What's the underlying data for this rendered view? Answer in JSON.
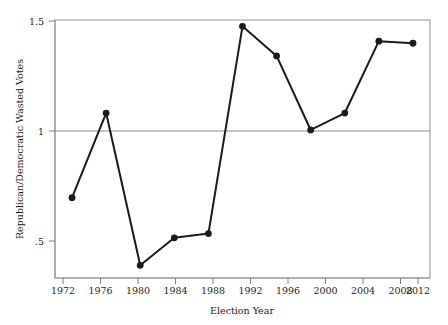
{
  "chart_data": {
    "type": "line",
    "title": "",
    "subtitle": "",
    "xlabel": "Election Year",
    "ylabel": "Republican/Democratic Wasted Votes",
    "x": [
      1972,
      1976,
      1980,
      1984,
      1988,
      1992,
      1996,
      2000,
      2004,
      2008,
      2012
    ],
    "values": [
      0.69,
      1.09,
      0.37,
      0.5,
      0.52,
      1.5,
      1.36,
      1.01,
      1.09,
      1.43,
      1.42
    ],
    "series": [
      {
        "name": "Republican/Democratic Wasted Votes",
        "values": [
          0.69,
          1.09,
          0.37,
          0.5,
          0.52,
          1.5,
          1.36,
          1.01,
          1.09,
          1.43,
          1.42
        ]
      }
    ],
    "xtick_labels": [
      "1972",
      "1976",
      "1980",
      "1984",
      "1988",
      "1992",
      "1996",
      "2000",
      "2004",
      "2008",
      "2012"
    ],
    "ytick_labels": [
      ".5",
      "1",
      "1.5"
    ],
    "ytick_values": [
      0.5,
      1.0,
      1.5
    ],
    "xlim": [
      1970,
      2014
    ],
    "ylim": [
      0.31,
      1.53
    ],
    "grid": false,
    "reference_line": {
      "axis": "y",
      "value": 1.0,
      "label": "1",
      "color": "#808080"
    },
    "legend": null,
    "legend_position": "none",
    "marker": "filled-circle",
    "line_color": "#1a1a1a",
    "marker_color": "#1a1a1a",
    "frame_color": "#9a9a9a",
    "background_color": "#ffffff",
    "annotations": []
  }
}
